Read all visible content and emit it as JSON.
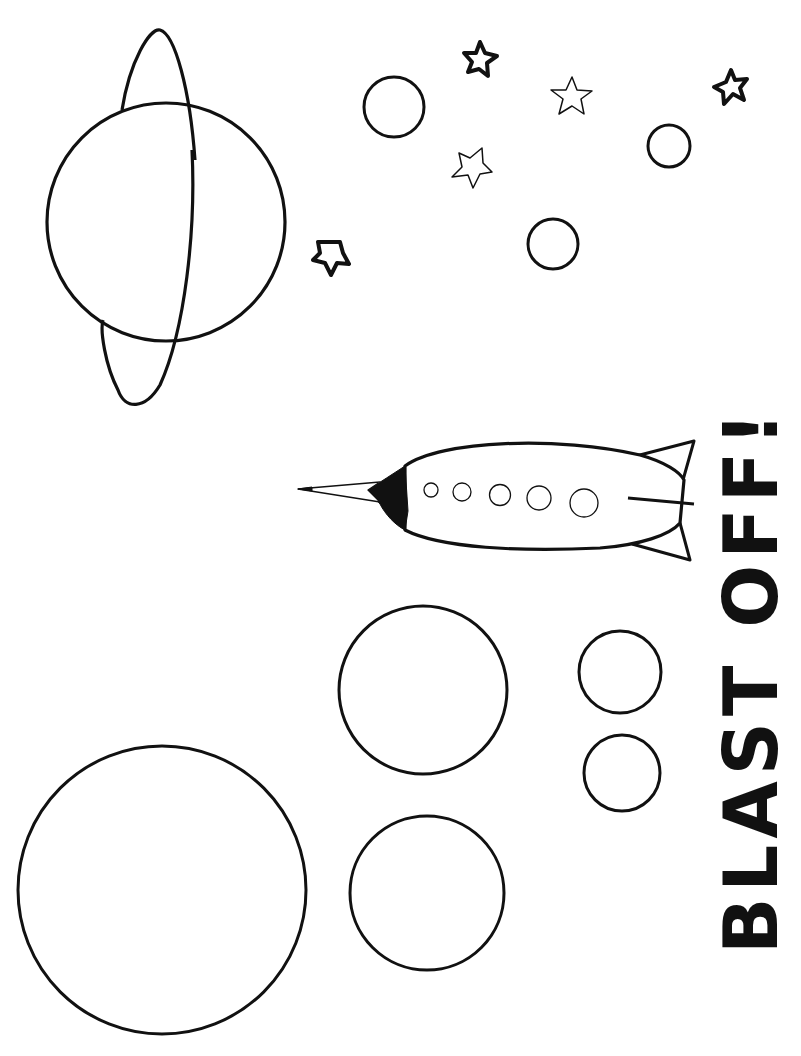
{
  "page": {
    "background": "#ffffff",
    "line_color": "#111111"
  },
  "title": {
    "text": "BLAST OFF!",
    "orientation": "rotated -90deg, reading bottom to top",
    "style": "stencil"
  },
  "elements": {
    "ringed_planet": {
      "label": "Ringed planet",
      "cx": 166,
      "cy": 222,
      "r": 119
    },
    "rocket": {
      "label": "Rocket ship",
      "portholes": 5
    },
    "stars": [
      {
        "label": "Star",
        "x": 480,
        "y": 58,
        "weight": "bold"
      },
      {
        "label": "Star",
        "x": 572,
        "y": 96,
        "weight": "thin"
      },
      {
        "label": "Star",
        "x": 732,
        "y": 87,
        "weight": "bold"
      },
      {
        "label": "Star",
        "x": 472,
        "y": 168,
        "weight": "thin"
      },
      {
        "label": "Star",
        "x": 330,
        "y": 257,
        "weight": "bold"
      }
    ],
    "small_planets": [
      {
        "label": "Small planet",
        "cx": 394,
        "cy": 107,
        "r": 30
      },
      {
        "label": "Small planet",
        "cx": 669,
        "cy": 146,
        "r": 21
      },
      {
        "label": "Small planet",
        "cx": 553,
        "cy": 244,
        "r": 25
      }
    ],
    "large_planets": [
      {
        "label": "Planet",
        "cx": 423,
        "cy": 690,
        "r": 84
      },
      {
        "label": "Planet",
        "cx": 620,
        "cy": 672,
        "r": 41
      },
      {
        "label": "Planet",
        "cx": 622,
        "cy": 773,
        "r": 38
      },
      {
        "label": "Planet",
        "cx": 427,
        "cy": 893,
        "r": 77
      },
      {
        "label": "Planet",
        "cx": 162,
        "cy": 890,
        "r": 144
      }
    ]
  }
}
